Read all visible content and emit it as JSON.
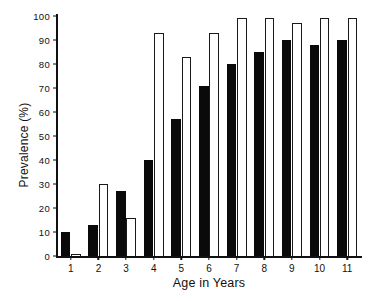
{
  "chart_data": {
    "type": "bar",
    "title": "",
    "xlabel": "Age in Years",
    "ylabel": "Prevalence (%)",
    "ylim": [
      0,
      100
    ],
    "yticks": [
      0,
      10,
      20,
      30,
      40,
      50,
      60,
      70,
      80,
      90,
      100
    ],
    "ytick_labels": [
      "0",
      "10",
      "20",
      "30",
      "40",
      "50",
      "60",
      "70",
      "80",
      "90",
      "100"
    ],
    "grid": false,
    "legend": "none",
    "categories": [
      "1",
      "2",
      "3",
      "4",
      "5",
      "6",
      "7",
      "8",
      "9",
      "10",
      "11"
    ],
    "series": [
      {
        "name": "black",
        "fill": "#0a0a0a",
        "values": [
          10,
          13,
          27,
          40,
          57,
          71,
          80,
          85,
          90,
          88,
          90
        ]
      },
      {
        "name": "white",
        "fill": "#ffffff",
        "values": [
          1,
          30,
          16,
          93,
          83,
          93,
          99,
          99,
          97,
          99,
          99
        ]
      }
    ]
  },
  "axes": {
    "y_label": "Prevalence (%)",
    "x_label": "Age in Years"
  }
}
